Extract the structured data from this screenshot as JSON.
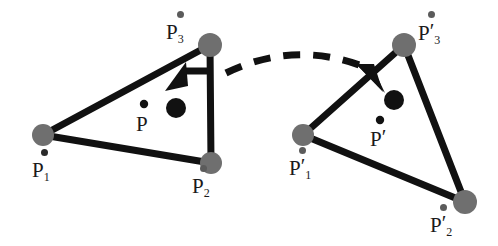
{
  "figure": {
    "background_color": "#ffffff",
    "edge_color": "#111111",
    "vertex_color": "#6f6f6f",
    "point_color": "#111111",
    "dashed_arc_color": "#111111",
    "label_color": "#1a1a1a"
  },
  "labels": {
    "p1": {
      "base": "P",
      "sub": "1",
      "prime": ""
    },
    "p2": {
      "base": "P",
      "sub": "2",
      "prime": ""
    },
    "p3": {
      "base": "P",
      "sub": "3",
      "prime": ""
    },
    "p": {
      "base": "P",
      "sub": "",
      "prime": ""
    },
    "p1prime": {
      "base": "P",
      "sub": "1",
      "prime": "′"
    },
    "p2prime": {
      "base": "P",
      "sub": "2",
      "prime": "′"
    },
    "p3prime": {
      "base": "P",
      "sub": "3",
      "prime": "′"
    },
    "pprime": {
      "base": "P",
      "sub": "",
      "prime": "′"
    }
  },
  "geometry": {
    "left_triangle": {
      "name": "source-triangle",
      "vertices": [
        {
          "id": "P1",
          "x": 43,
          "y": 135
        },
        {
          "id": "P2",
          "x": 211,
          "y": 163
        },
        {
          "id": "P3",
          "x": 210,
          "y": 45
        }
      ],
      "centroid_point": {
        "id": "P",
        "x": 144,
        "y": 104
      },
      "displaced_point": {
        "id": "P-moved",
        "x": 176,
        "y": 108
      },
      "arrow": {
        "from_x": 211,
        "from_y": 71,
        "to_x": 172,
        "to_y": 92
      }
    },
    "right_triangle": {
      "name": "target-triangle",
      "vertices": [
        {
          "id": "P1prime",
          "x": 303,
          "y": 135
        },
        {
          "id": "P2prime",
          "x": 465,
          "y": 202
        },
        {
          "id": "P3prime",
          "x": 404,
          "y": 45
        }
      ],
      "centroid_point": {
        "id": "Pprime",
        "x": 380,
        "y": 120
      },
      "displaced_point": {
        "id": "Pprime-moved",
        "x": 394,
        "y": 100
      },
      "arrow": {
        "from_x": 357,
        "from_y": 66,
        "to_x": 387,
        "to_y": 92
      }
    },
    "dashed_arc": {
      "name": "correspondence-arc",
      "start_x": 226,
      "start_y": 73,
      "ctrl_x": 298,
      "ctrl_y": 38,
      "end_x": 372,
      "end_y": 70,
      "dash_pattern": "17 13",
      "stroke_width": 7
    }
  },
  "label_positions": {
    "p3": {
      "x": 166,
      "y": 22,
      "dot_x": 180,
      "dot_y": 14
    },
    "p": {
      "x": 137,
      "y": 116,
      "dot_x": 143,
      "dot_y": 101
    },
    "p1": {
      "x": 32,
      "y": 162,
      "dot_x": 44,
      "dot_y": 152
    },
    "p2": {
      "x": 192,
      "y": 178,
      "dot_x": 203,
      "dot_y": 167
    },
    "p3prime": {
      "x": 420,
      "y": 24,
      "dot_x": 431,
      "dot_y": 14
    },
    "pprime": {
      "x": 370,
      "y": 131,
      "dot_x": 379,
      "dot_y": 119
    },
    "p1prime": {
      "x": 290,
      "y": 160,
      "dot_x": 302,
      "dot_y": 150
    },
    "p2prime": {
      "x": 432,
      "y": 216,
      "dot_x": 443,
      "dot_y": 206
    }
  }
}
